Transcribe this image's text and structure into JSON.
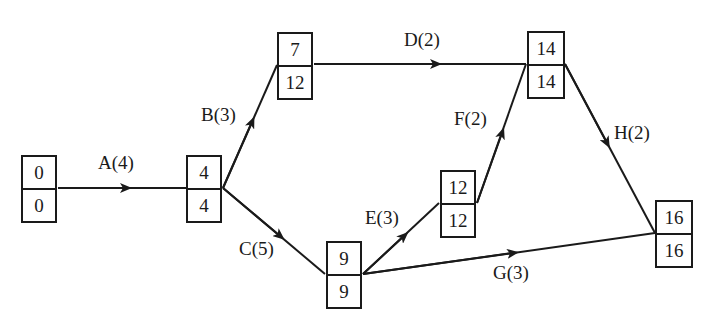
{
  "diagram": {
    "type": "activity-on-arrow network (critical path)",
    "nodes": [
      {
        "id": "n0",
        "top": "0",
        "bottom": "0"
      },
      {
        "id": "n1",
        "top": "4",
        "bottom": "4"
      },
      {
        "id": "n2",
        "top": "7",
        "bottom": "12"
      },
      {
        "id": "n3",
        "top": "9",
        "bottom": "9"
      },
      {
        "id": "n4",
        "top": "12",
        "bottom": "12"
      },
      {
        "id": "n5",
        "top": "14",
        "bottom": "14"
      },
      {
        "id": "n6",
        "top": "16",
        "bottom": "16"
      }
    ],
    "edges": [
      {
        "from": "n0",
        "to": "n1",
        "label": "A(4)"
      },
      {
        "from": "n1",
        "to": "n2",
        "label": "B(3)"
      },
      {
        "from": "n1",
        "to": "n3",
        "label": "C(5)"
      },
      {
        "from": "n2",
        "to": "n5",
        "label": "D(2)"
      },
      {
        "from": "n3",
        "to": "n4",
        "label": "E(3)"
      },
      {
        "from": "n4",
        "to": "n5",
        "label": "F(2)"
      },
      {
        "from": "n3",
        "to": "n6",
        "label": "G(3)"
      },
      {
        "from": "n5",
        "to": "n6",
        "label": "H(2)"
      }
    ],
    "colors": {
      "line": "#1a1a1a",
      "background": "#ffffff"
    }
  }
}
